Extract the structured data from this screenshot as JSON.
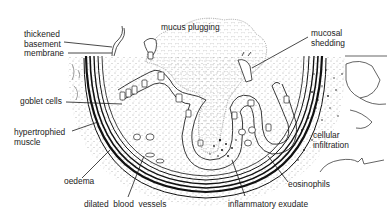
{
  "diagram": {
    "colors": {
      "ink": "#1a1a1a",
      "background": "#ffffff",
      "text": "#222222"
    },
    "labels": [
      {
        "id": "thickened-basement-membrane",
        "text": "thickened\nbasement\nmembrane",
        "x": 24,
        "y": 30
      },
      {
        "id": "mucus-plugging",
        "text": "mucus plugging",
        "x": 161,
        "y": 25
      },
      {
        "id": "mucosal-shedding",
        "text": "mucosal\nshedding",
        "x": 311,
        "y": 28
      },
      {
        "id": "goblet-cells",
        "text": "goblet cells",
        "x": 20,
        "y": 97
      },
      {
        "id": "hypertrophied-muscle",
        "text": "hypertrophied\nmuscle",
        "x": 14,
        "y": 128
      },
      {
        "id": "cellular-infiltration",
        "text": "cellular\ninfiltration",
        "x": 313,
        "y": 131
      },
      {
        "id": "oedema",
        "text": "oedema",
        "x": 64,
        "y": 177
      },
      {
        "id": "eosinophils",
        "text": "eosinophils",
        "x": 288,
        "y": 180
      },
      {
        "id": "inflammatory-exudate",
        "text": "inflammatory exudate",
        "x": 228,
        "y": 200
      },
      {
        "id": "dilated-blood-vessels",
        "text": "dilated  blood  vessels",
        "x": 84,
        "y": 200
      }
    ]
  }
}
